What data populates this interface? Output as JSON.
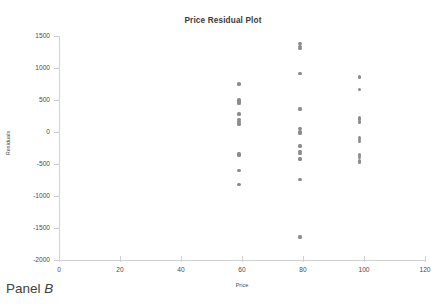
{
  "figure": {
    "caption_prefix": "Panel ",
    "caption_letter": "B"
  },
  "chart_data": {
    "type": "scatter",
    "title": "Price Residual Plot",
    "xlabel": "Price",
    "ylabel": "Residuals",
    "xlim": [
      0,
      120
    ],
    "ylim": [
      -2000,
      1500
    ],
    "xticks": [
      0,
      20,
      40,
      60,
      80,
      100,
      120
    ],
    "yticks": [
      1500,
      1000,
      500,
      0,
      -500,
      -1000,
      -1500,
      -2000
    ],
    "grid": false,
    "legend": false,
    "marker_color": "#8c8c8c",
    "series": [
      {
        "name": "Residuals",
        "points": [
          [
            59,
            750
          ],
          [
            59,
            500
          ],
          [
            59,
            470
          ],
          [
            59,
            440
          ],
          [
            59,
            280
          ],
          [
            59,
            190
          ],
          [
            59,
            160
          ],
          [
            59,
            130
          ],
          [
            59,
            120
          ],
          [
            59,
            -340
          ],
          [
            59,
            -360
          ],
          [
            59,
            -600
          ],
          [
            59,
            -820
          ],
          [
            79,
            1380
          ],
          [
            79,
            1340
          ],
          [
            79,
            1310
          ],
          [
            79,
            910
          ],
          [
            79,
            360
          ],
          [
            79,
            60
          ],
          [
            79,
            0
          ],
          [
            79,
            -20
          ],
          [
            79,
            -220
          ],
          [
            79,
            -300
          ],
          [
            79,
            -330
          ],
          [
            79,
            -410
          ],
          [
            79,
            -430
          ],
          [
            79,
            -740
          ],
          [
            79,
            -1640
          ],
          [
            98.5,
            860
          ],
          [
            98.5,
            670
          ],
          [
            98.5,
            220
          ],
          [
            98.5,
            190
          ],
          [
            98.5,
            170
          ],
          [
            98.5,
            150
          ],
          [
            98.5,
            -90
          ],
          [
            98.5,
            -120
          ],
          [
            98.5,
            -150
          ],
          [
            98.5,
            -360
          ],
          [
            98.5,
            -400
          ],
          [
            98.5,
            -440
          ],
          [
            98.5,
            -470
          ]
        ]
      }
    ]
  }
}
